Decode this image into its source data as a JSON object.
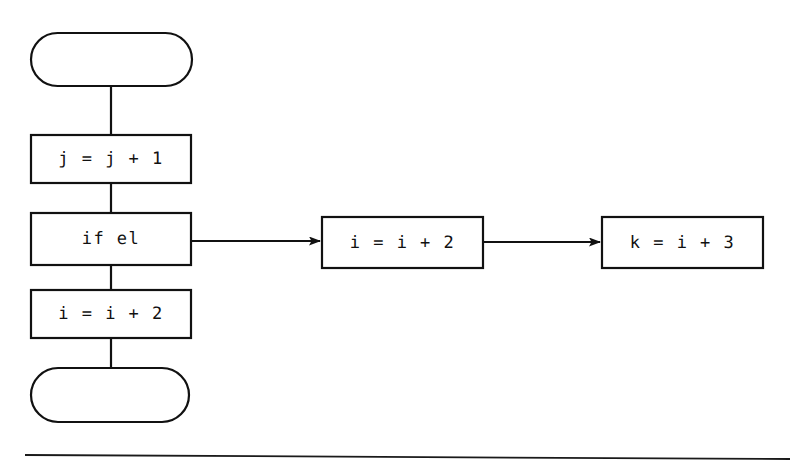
{
  "diagram": {
    "type": "flowchart",
    "background_color": "#ffffff",
    "stroke_color": "#111111",
    "title": "",
    "nodes": [
      {
        "id": "start",
        "shape": "terminator",
        "text": "",
        "x": 31,
        "y": 33,
        "w": 161,
        "h": 53
      },
      {
        "id": "assign-j",
        "shape": "process",
        "text": "j = j + 1",
        "x": 31,
        "y": 135,
        "w": 160,
        "h": 48
      },
      {
        "id": "if-el",
        "shape": "process",
        "text": "if el",
        "x": 31,
        "y": 213,
        "w": 160,
        "h": 52
      },
      {
        "id": "assign-i",
        "shape": "process",
        "text": "i = i + 2",
        "x": 31,
        "y": 290,
        "w": 160,
        "h": 48
      },
      {
        "id": "end",
        "shape": "terminator",
        "text": "",
        "x": 31,
        "y": 368,
        "w": 158,
        "h": 54
      },
      {
        "id": "assign-i2",
        "shape": "process",
        "text": "i = i + 2",
        "x": 322,
        "y": 217,
        "w": 161,
        "h": 51
      },
      {
        "id": "assign-k",
        "shape": "process",
        "text": "k = i + 3",
        "x": 602,
        "y": 217,
        "w": 161,
        "h": 51
      }
    ],
    "edges": [
      {
        "from": "start",
        "to": "assign-j",
        "style": "plain",
        "arrowhead": false,
        "label": ""
      },
      {
        "from": "assign-j",
        "to": "if-el",
        "style": "plain",
        "arrowhead": false,
        "label": ""
      },
      {
        "from": "if-el",
        "to": "assign-i",
        "style": "plain",
        "arrowhead": false,
        "label": ""
      },
      {
        "from": "assign-i",
        "to": "end",
        "style": "plain",
        "arrowhead": false,
        "label": ""
      },
      {
        "from": "if-el",
        "to": "assign-i2",
        "style": "arrow",
        "arrowhead": true,
        "label": ""
      },
      {
        "from": "assign-i2",
        "to": "assign-k",
        "style": "arrow",
        "arrowhead": true,
        "label": ""
      }
    ],
    "footer_rule": {
      "x1": 25,
      "y1": 455,
      "x2": 790,
      "y2": 459
    }
  }
}
